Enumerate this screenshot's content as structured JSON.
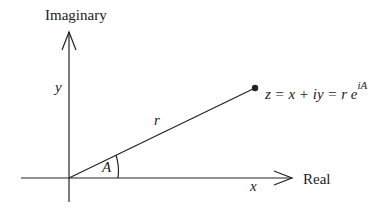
{
  "diagram": {
    "axes": {
      "vertical_label": "Imaginary",
      "horizontal_label": "Real"
    },
    "labels": {
      "y": "y",
      "x": "x",
      "r": "r",
      "angle": "A",
      "point_eq_base": "z = x + iy = r e",
      "point_eq_exp": "iA"
    },
    "colors": {
      "line": "#222222",
      "background": "#ffffff"
    }
  }
}
